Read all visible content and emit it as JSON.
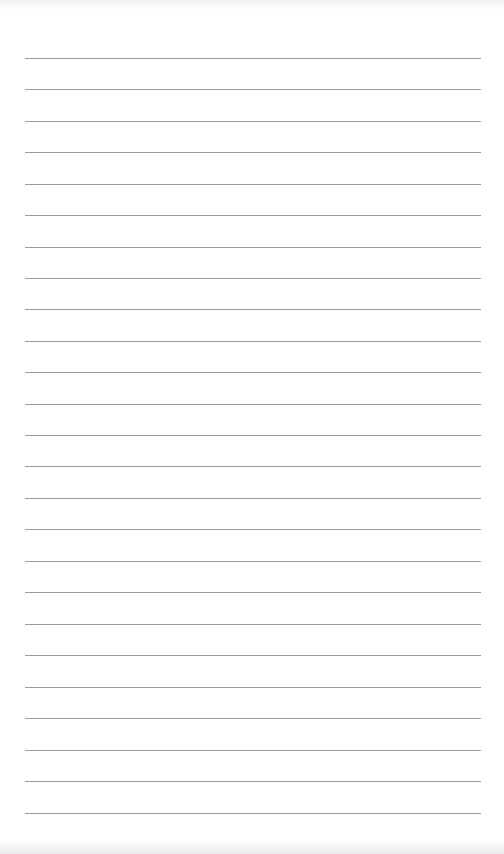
{
  "page": {
    "type": "lined-paper",
    "background_color": "#ffffff",
    "line_color": "#9a9a9a",
    "line_count": 25,
    "line_left": 25,
    "line_right": 481,
    "line_positions_y": [
      58,
      89,
      121,
      152,
      184,
      215,
      247,
      278,
      309,
      341,
      372,
      404,
      435,
      466,
      498,
      529,
      561,
      592,
      624,
      655,
      687,
      718,
      750,
      781,
      813
    ]
  }
}
